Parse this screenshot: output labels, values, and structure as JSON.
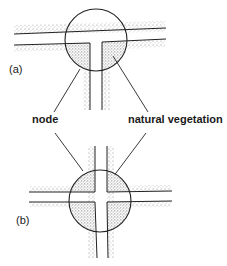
{
  "diagram": {
    "panels": [
      {
        "id": "a",
        "label": "(a)",
        "junction": "T-junction"
      },
      {
        "id": "b",
        "label": "(b)",
        "junction": "cross-junction"
      }
    ],
    "annotations": {
      "node": "node",
      "vegetation": "natural vegetation"
    },
    "colors": {
      "line": "#222222",
      "stipple": "#8a8a8a",
      "background": "#ffffff"
    }
  }
}
